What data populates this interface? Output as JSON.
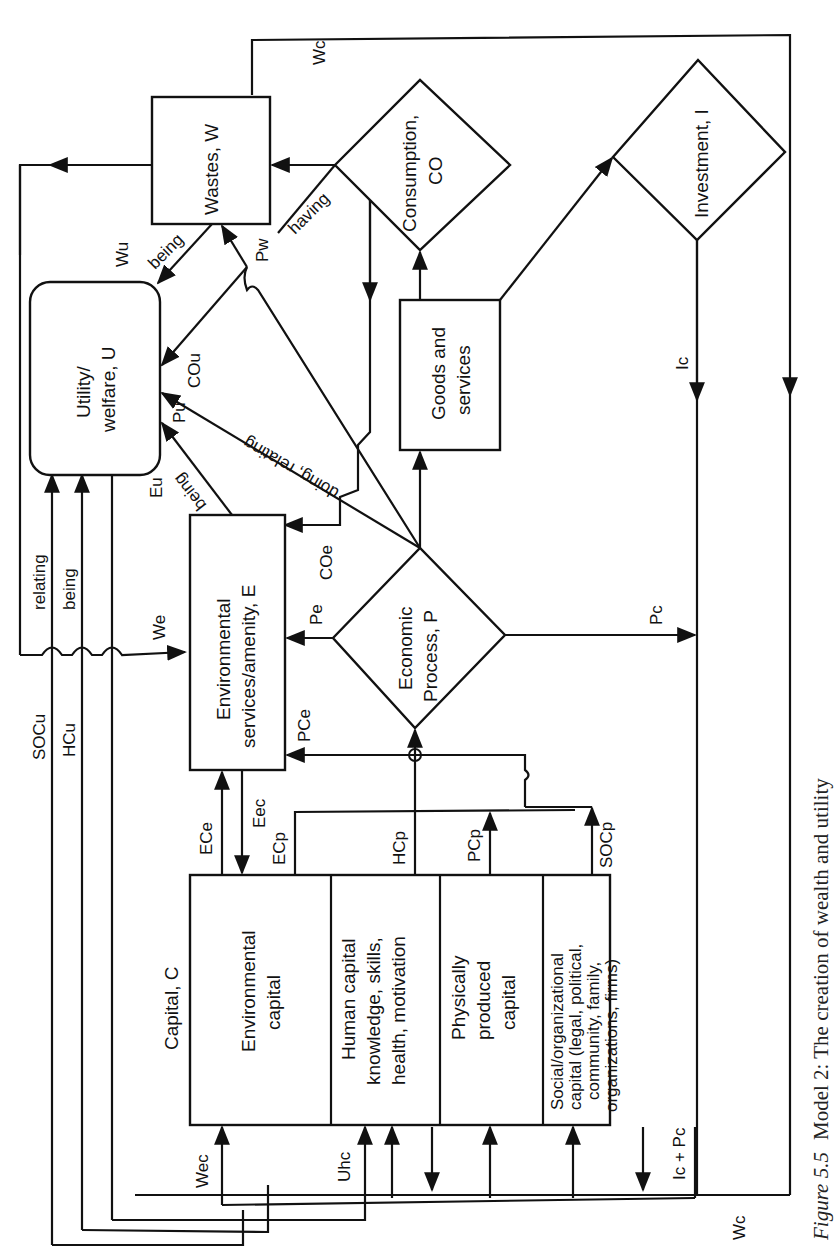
{
  "figure": {
    "caption_prefix": "Figure 5.5",
    "caption_text": "Model 2: The creation of wealth and utility",
    "orientation": "rotated 90° counter-clockwise"
  },
  "nodes": {
    "wastes": "Wastes, W",
    "utility_line1": "Utility/",
    "utility_line2": "welfare, U",
    "consumption_line1": "Consumption,",
    "consumption_line2": "CO",
    "goods_line1": "Goods and",
    "goods_line2": "services",
    "investment": "Investment, I",
    "environmental_line1": "Environmental",
    "environmental_line2": "services/amenity, E",
    "economic_line1": "Economic",
    "economic_line2": "Process, P",
    "capital_title": "Capital, C",
    "cap_env_line1": "Environmental",
    "cap_env_line2": "capital",
    "cap_human_line1": "Human capital",
    "cap_human_line2": "knowledge, skills,",
    "cap_human_line3": "health, motivation",
    "cap_phys_line1": "Physically",
    "cap_phys_line2": "produced",
    "cap_phys_line3": "capital",
    "cap_social_line1": "Social/organizational",
    "cap_social_line2": "capital (legal, political,",
    "cap_social_line3": "community, family,",
    "cap_social_line4": "organizations, firms)"
  },
  "flows": {
    "Wc_top": "Wc",
    "having": "having",
    "Pw": "Pw",
    "Wu": "Wu",
    "being_wu": "being",
    "COu": "COu",
    "doing_relating": "doing, relating",
    "Pu": "Pu",
    "being_eu": "being",
    "Eu": "Eu",
    "relating": "relating",
    "being_hc": "being",
    "We": "We",
    "COe": "COe",
    "Pe": "Pe",
    "PCe": "PCe",
    "SOCu": "SOCu",
    "HCu": "HCu",
    "ECe": "ECe",
    "Eec": "Eec",
    "ECp": "ECp",
    "HCp": "HCp",
    "PCp": "PCp",
    "SOCp": "SOCp",
    "Pc": "Pc",
    "Ic": "Ic",
    "Wec": "Wec",
    "Uhc": "Uhc",
    "IcPc": "Ic + Pc",
    "Wc_bottom": "Wc"
  }
}
